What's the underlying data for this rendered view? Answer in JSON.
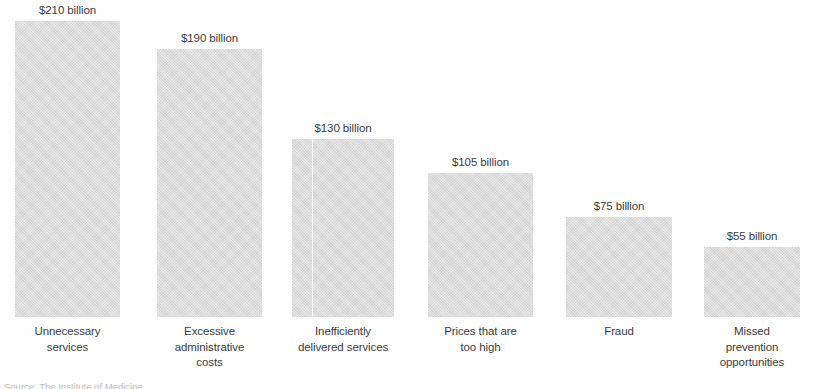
{
  "chart_data": {
    "type": "bar",
    "title": "",
    "subtitle": "",
    "xlabel": "",
    "ylabel": "",
    "grid": false,
    "legend": false,
    "orientation": "vertical",
    "units": "billions of US dollars",
    "ylim": [
      0,
      210
    ],
    "categories": [
      "Unnecessary services",
      "Excessive administrative costs",
      "Inefficiently delivered services",
      "Prices that are too high",
      "Fraud",
      "Missed prevention opportunities"
    ],
    "values": [
      210,
      190,
      130,
      105,
      75,
      55
    ],
    "data_labels": [
      "$210 billion",
      "$190 billion",
      "$130 billion",
      "$105 billion",
      "$75 billion",
      "$55 billion"
    ],
    "tick_labels": [
      "Unnecessary\nservices",
      "Excessive\nadministrative\ncosts",
      "Inefficiently\ndelivered services",
      "Prices that are\ntoo high",
      "Fraud",
      "Missed\nprevention\nopportunities"
    ]
  },
  "bars": [
    {
      "value_label": "$210 billion",
      "category_lines": [
        "Unnecessary",
        "services"
      ],
      "left": 15,
      "width": 105,
      "height": 296,
      "seam": null
    },
    {
      "value_label": "$190 billion",
      "category_lines": [
        "Excessive",
        "administrative",
        "costs"
      ],
      "left": 157,
      "width": 105,
      "height": 268,
      "seam": null
    },
    {
      "value_label": "$130 billion",
      "category_lines": [
        "Inefficiently",
        "delivered services"
      ],
      "left": 292,
      "width": 102,
      "height": 178,
      "seam": 20
    },
    {
      "value_label": "$105 billion",
      "category_lines": [
        "Prices that are",
        "too high"
      ],
      "left": 428,
      "width": 105,
      "height": 144,
      "seam": null
    },
    {
      "value_label": "$75 billion",
      "category_lines": [
        "Fraud"
      ],
      "left": 566,
      "width": 106,
      "height": 100,
      "seam": null
    },
    {
      "value_label": "$55 billion",
      "category_lines": [
        "Missed",
        "prevention",
        "opportunities"
      ],
      "left": 704,
      "width": 96,
      "height": 70,
      "seam": null
    }
  ],
  "colors": {
    "bar_fill": "#dcdcdc",
    "label_text": "#3c3c3c",
    "background": "#ffffff",
    "source_text": "#b9b9b9"
  },
  "source_note": {
    "text": "Source: The Institute of Medicine",
    "clipped": true
  }
}
